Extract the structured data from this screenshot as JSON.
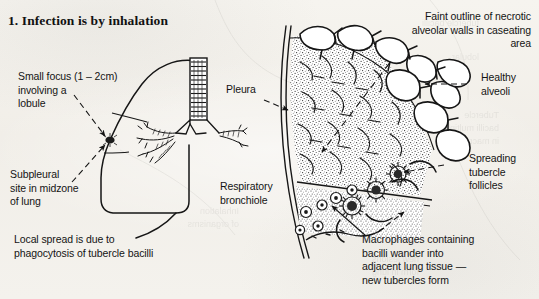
{
  "page": {
    "title": "1. Infection is by inhalation",
    "background_color": "#f3f1ec",
    "ink_color": "#141414"
  },
  "labels": {
    "small_focus": "Small focus (1 – 2cm)\ninvolving a\nlobule",
    "subpleural_site": "Subpleural\nsite in midzone\nof lung",
    "local_spread": "Local spread is due to\nphagocytosis of tubercle bacilli",
    "pleura": "Pleura",
    "respiratory_bronchiole": "Respiratory\nbronchiole",
    "faint_outline": "Faint outline of necrotic\nalveolar walls in caseating\narea",
    "healthy_alveoli": "Healthy\nalveoli",
    "spreading_follicles": "Spreading\ntubercle follicles",
    "macrophages": "Macrophages containing\nbacilli wander into\nadjacent lung tissue —\nnew tubercles form"
  },
  "figure_parts": {
    "lung_outline": "lung-outline",
    "trachea": "trachea",
    "bronchial_tree": "bronchial-tree",
    "infection_focus": "infection-focus-nodule",
    "pleural_line": "pleural-membrane-line",
    "caseating_area": "caseating-necrosis-wedge",
    "alveoli_cluster": "healthy-alveoli-cluster",
    "tubercle_follicles": "tubercle-follicle-group",
    "macrophage_cells": "macrophage-cell-group",
    "bronchiole_wall": "respiratory-bronchiole-wall"
  }
}
